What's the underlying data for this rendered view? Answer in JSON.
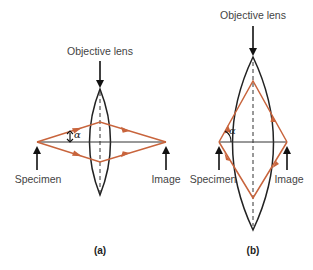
{
  "figure": {
    "panels": [
      {
        "id": "a",
        "panel_label": "(a)",
        "lens_label": "Objective lens",
        "specimen_label": "Specimen",
        "image_label": "Image",
        "angle_label": "α",
        "description": "Low numerical aperture: thin lens, small half-angle α"
      },
      {
        "id": "b",
        "panel_label": "(b)",
        "lens_label": "Objective lens",
        "specimen_label": "Specimen",
        "image_label": "Image",
        "angle_label": "α",
        "description": "High numerical aperture: thick lens, large half-angle α"
      }
    ],
    "colors": {
      "ray": "#c8643c",
      "lens": "#222222",
      "axis": "#333333",
      "text": "#444444"
    }
  }
}
